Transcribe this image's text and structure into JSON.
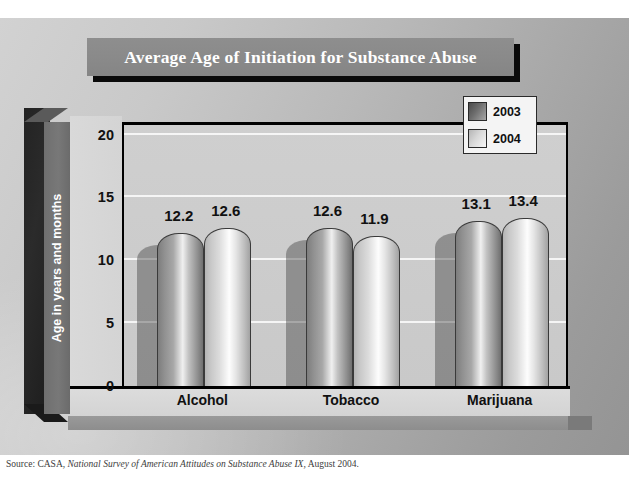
{
  "chart_data": {
    "type": "bar",
    "title": "Average Age of Initiation for Substance Abuse",
    "xlabel": "",
    "ylabel": "Age in years and months",
    "categories": [
      "Alcohol",
      "Tobacco",
      "Marijuana"
    ],
    "series": [
      {
        "name": "2003",
        "values": [
          12.2,
          12.6,
          13.1
        ]
      },
      {
        "name": "2004",
        "values": [
          12.6,
          11.9,
          13.4
        ]
      }
    ],
    "ylim": [
      0,
      21
    ],
    "yticks": [
      0,
      5,
      10,
      15,
      20
    ],
    "ytick_labels": [
      "0",
      "5",
      "10",
      "15",
      "20"
    ],
    "grid": true,
    "legend_position": "top-right",
    "style": "3d-cylinder-bars",
    "data_labels": [
      "12.2",
      "12.6",
      "12.6",
      "11.9",
      "13.1",
      "13.4"
    ]
  },
  "legend": {
    "items": [
      {
        "label": "2003",
        "swatch": "dark-gray-gradient"
      },
      {
        "label": "2004",
        "swatch": "light-gray-gradient"
      }
    ]
  },
  "source": {
    "prefix": "Source: CASA,",
    "italic": "National Survey of American Attitudes on Substance Abuse IX,",
    "suffix": "August 2004."
  },
  "colors": {
    "title_plaque": "#8a8a8a",
    "title_text": "#ffffff",
    "axis_band": "#787878",
    "plot_bg": "#cbcbcb",
    "bar_2003": "#8f8f8f",
    "bar_2004": "#dcdcdc",
    "outline": "#000000"
  }
}
